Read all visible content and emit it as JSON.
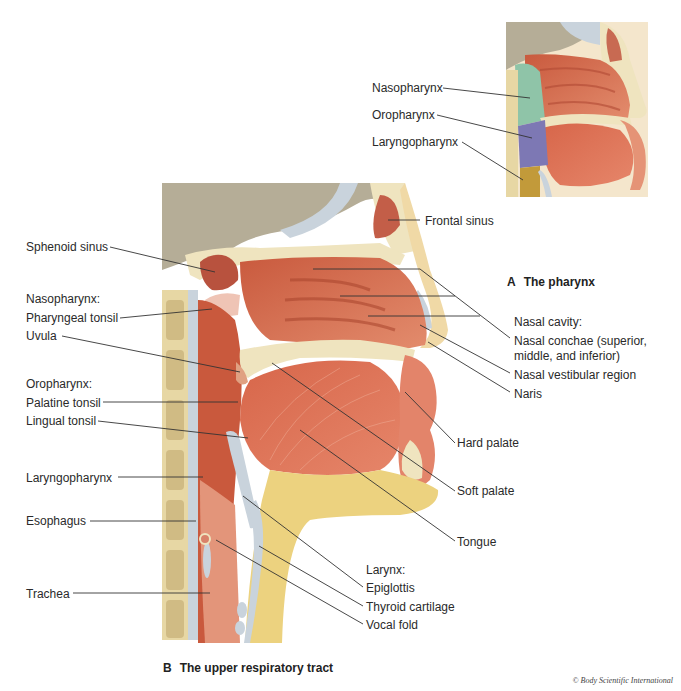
{
  "figure_a": {
    "caption_letter": "A",
    "caption_text": "The pharynx",
    "labels": [
      {
        "text": "Nasopharynx",
        "x": 372,
        "y": 81,
        "tx": 530,
        "ty": 98
      },
      {
        "text": "Oropharynx",
        "x": 372,
        "y": 108,
        "tx": 532,
        "ty": 138
      },
      {
        "text": "Laryngopharynx",
        "x": 372,
        "y": 135,
        "tx": 523,
        "ty": 180
      }
    ],
    "region_colors": {
      "nasopharynx": "#8fc4a8",
      "oropharynx": "#7d78b4",
      "laryngopharynx": "#c29a3a"
    }
  },
  "figure_b": {
    "caption_letter": "B",
    "caption_text": "The upper respiratory tract",
    "labels_left": [
      {
        "text": "Sphenoid sinus",
        "x": 26,
        "y": 240,
        "lx": 110,
        "ly": 247,
        "tx": 215,
        "ty": 272
      },
      {
        "text": "Nasopharynx:",
        "x": 26,
        "y": 292
      },
      {
        "text": "Pharyngeal tonsil",
        "x": 26,
        "y": 311,
        "lx": 120,
        "ly": 318,
        "tx": 212,
        "ty": 309
      },
      {
        "text": "Uvula",
        "x": 26,
        "y": 329,
        "lx": 62,
        "ly": 336,
        "tx": 240,
        "ty": 372
      },
      {
        "text": "Oropharynx:",
        "x": 26,
        "y": 377
      },
      {
        "text": "Palatine tonsil",
        "x": 26,
        "y": 396,
        "lx": 103,
        "ly": 402,
        "tx": 238,
        "ty": 402
      },
      {
        "text": "Lingual tonsil",
        "x": 26,
        "y": 414,
        "lx": 98,
        "ly": 421,
        "tx": 248,
        "ty": 438
      },
      {
        "text": "Laryngopharynx",
        "x": 26,
        "y": 471,
        "lx": 118,
        "ly": 477,
        "tx": 203,
        "ty": 477
      },
      {
        "text": "Esophagus",
        "x": 26,
        "y": 514,
        "lx": 90,
        "ly": 521,
        "tx": 196,
        "ty": 521
      },
      {
        "text": "Trachea",
        "x": 26,
        "y": 587,
        "lx": 73,
        "ly": 593,
        "tx": 210,
        "ty": 593
      }
    ],
    "labels_right": [
      {
        "text": "Frontal sinus",
        "x": 425,
        "y": 214,
        "lx": 420,
        "ly": 220,
        "tx": 388,
        "ty": 220
      },
      {
        "text": "Nasal cavity:",
        "x": 514,
        "y": 315
      },
      {
        "text": "Nasal conchae (superior,",
        "x": 514,
        "y": 334
      },
      {
        "text": "middle, and inferior)",
        "x": 514,
        "y": 349
      },
      {
        "text": "Nasal vestibular region",
        "x": 514,
        "y": 368
      },
      {
        "text": "Naris",
        "x": 514,
        "y": 387
      },
      {
        "text": "Hard palate",
        "x": 457,
        "y": 436,
        "lx": 455,
        "ly": 443,
        "tx": 405,
        "ty": 392
      },
      {
        "text": "Soft palate",
        "x": 457,
        "y": 484,
        "lx": 455,
        "ly": 491,
        "tx": 272,
        "ty": 363
      },
      {
        "text": "Tongue",
        "x": 457,
        "y": 535,
        "lx": 455,
        "ly": 541,
        "tx": 300,
        "ty": 430
      },
      {
        "text": "Larynx:",
        "x": 366,
        "y": 563
      },
      {
        "text": "Epiglottis",
        "x": 366,
        "y": 581,
        "lx": 363,
        "ly": 587,
        "tx": 243,
        "ty": 496
      },
      {
        "text": "Thyroid cartilage",
        "x": 366,
        "y": 600,
        "lx": 363,
        "ly": 606,
        "tx": 259,
        "ty": 546
      },
      {
        "text": "Vocal fold",
        "x": 366,
        "y": 618,
        "lx": 363,
        "ly": 624,
        "tx": 216,
        "ty": 540
      }
    ],
    "conchae_targets": [
      [
        313,
        269
      ],
      [
        340,
        296
      ],
      [
        368,
        316
      ]
    ],
    "nasal_leader_points": {
      "vestibular_target": [
        420,
        325
      ],
      "naris_target": [
        428,
        342
      ]
    }
  },
  "credit": "© Body Scientific International",
  "colors": {
    "skull_bg": "#b5ad97",
    "bone": "#efe4bf",
    "tissue": "#d06a4d",
    "tissue_light": "#e08a6b",
    "cartilage": "#c9d3dc",
    "fat": "#ecd27f",
    "leader": "#333333"
  }
}
